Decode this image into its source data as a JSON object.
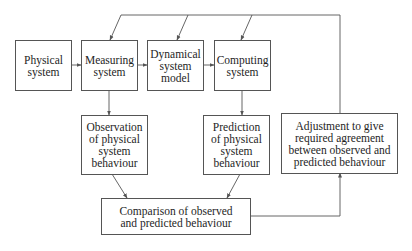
{
  "diagram": {
    "nodes": {
      "physical_system": {
        "label": "Physical\nsystem"
      },
      "measuring_system": {
        "label": "Measuring\nsystem"
      },
      "dynamical_model": {
        "label": "Dynamical\nsystem\nmodel"
      },
      "computing_system": {
        "label": "Computing\nsystem"
      },
      "observation": {
        "label": "Observation\nof physical\nsystem\nbehaviour"
      },
      "prediction": {
        "label": "Prediction\nof physical\nsystem\nbehaviour"
      },
      "adjustment": {
        "label": "Adjustment to give\nrequired agreement\nbetween observed and\npredicted behaviour"
      },
      "comparison": {
        "label": "Comparison of observed\nand predicted behaviour"
      }
    },
    "edges": [
      {
        "from": "physical_system",
        "to": "measuring_system"
      },
      {
        "from": "measuring_system",
        "to": "dynamical_model"
      },
      {
        "from": "dynamical_model",
        "to": "computing_system"
      },
      {
        "from": "measuring_system",
        "to": "observation"
      },
      {
        "from": "computing_system",
        "to": "prediction"
      },
      {
        "from": "observation",
        "to": "comparison"
      },
      {
        "from": "prediction",
        "to": "comparison"
      },
      {
        "from": "comparison",
        "to": "adjustment"
      },
      {
        "from": "adjustment",
        "to": "measuring_system"
      },
      {
        "from": "adjustment",
        "to": "dynamical_model"
      },
      {
        "from": "adjustment",
        "to": "computing_system"
      }
    ],
    "line_color": "#555555"
  }
}
